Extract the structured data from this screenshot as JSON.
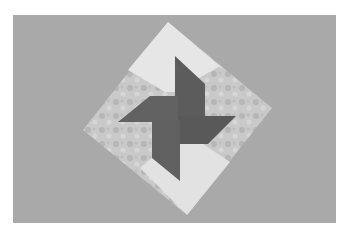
{
  "image": {
    "subject": "pinwheel-quilt-block",
    "colors": {
      "background": "#a9a9a9",
      "light_fabric": "#e4e4e4",
      "print_fabric": "#c6c6c6",
      "dark_fabric": "#5f5f5f",
      "border": "#ffffff"
    }
  }
}
